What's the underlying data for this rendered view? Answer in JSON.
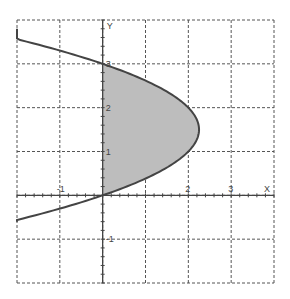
{
  "chart_data": {
    "type": "area",
    "title": "",
    "xlabel": "X",
    "ylabel": "Y",
    "xlim": [
      -2,
      4
    ],
    "ylim": [
      -2,
      4
    ],
    "grid": true,
    "x_ticks": [
      -1,
      2,
      3
    ],
    "x_tick_labels": [
      "-1",
      "2",
      "3"
    ],
    "y_ticks": [
      3,
      2,
      1,
      -1
    ],
    "y_tick_labels": [
      "3",
      "2",
      "1",
      "-1"
    ],
    "curve": {
      "name": "x = 3y - y^2",
      "equation": "x = 3y - y^2",
      "y_range": [
        -0.6,
        3.8
      ]
    },
    "shaded_region": {
      "description": "Region bounded by x = 3y - y^2 and the y-axis (x = 0)",
      "y_range": [
        0,
        3
      ],
      "color": "#bdbdbd"
    },
    "colors": {
      "curve": "#444444",
      "grid": "#555555",
      "fill": "#bdbdbd"
    }
  }
}
